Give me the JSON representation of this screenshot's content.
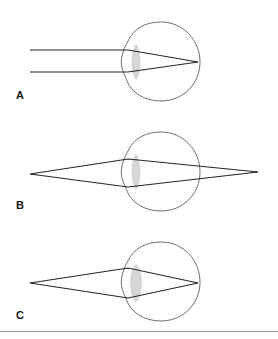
{
  "figure": {
    "panel_count": 3,
    "background_color": "#ffffff",
    "outline_color": "#6e6e78",
    "ray_color": "#252525",
    "lens_color": "#cfcfcf",
    "rule_color": "#9a9a9a"
  },
  "panels": [
    {
      "label": "A",
      "condition": "parallel-rays-focus-on-retina",
      "ray_description": "Two parallel horizontal rays enter from the left, are refracted by the cornea and lens, and converge to a single focal point at the back of the eye.",
      "focal_point": {
        "x": 198,
        "y": 62
      },
      "incoming_rays": [
        {
          "start_x": 30,
          "start_y": 50,
          "end_x": 198,
          "end_y": 62
        },
        {
          "start_x": 30,
          "start_y": 72,
          "end_x": 198,
          "end_y": 62
        }
      ],
      "ray_bend_x": 128,
      "eye": {
        "center_x": 161,
        "center_y": 62,
        "radius": 39
      }
    },
    {
      "label": "B",
      "condition": "rays-cross-and-diverge-beyond-eye",
      "ray_description": "Rays converge from a point at the far left, cross within the eye near the retina, and continue to a point at the far right.",
      "left_point": {
        "x": 30,
        "y": 174
      },
      "right_point": {
        "x": 258,
        "y": 172
      },
      "crossing_point": {
        "x": 194,
        "y": 173
      },
      "eye": {
        "center_x": 161,
        "center_y": 172,
        "radius": 39
      }
    },
    {
      "label": "C",
      "condition": "divergent-rays-focus-on-retina",
      "ray_description": "Rays diverge from a near point at the left, are refracted, and converge to a focal point at the back of the eye.",
      "source_point": {
        "x": 30,
        "y": 283
      },
      "focal_point": {
        "x": 198,
        "y": 283
      },
      "eye": {
        "center_x": 161,
        "center_y": 282,
        "radius": 39
      }
    }
  ],
  "footer": {
    "rule_present": true,
    "rule_y": 331
  }
}
